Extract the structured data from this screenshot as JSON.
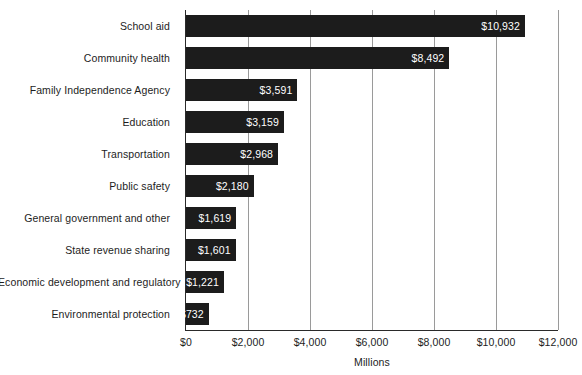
{
  "chart_data": {
    "type": "bar",
    "orientation": "horizontal",
    "title": "",
    "xlabel": "Millions",
    "ylabel": "",
    "xlim": [
      0,
      12000
    ],
    "xticks": [
      0,
      2000,
      4000,
      6000,
      8000,
      10000,
      12000
    ],
    "xtick_labels": [
      "$0",
      "$2,000",
      "$4,000",
      "$6,000",
      "$8,000",
      "$10,000",
      "$12,000"
    ],
    "grid": true,
    "legend": false,
    "bar_color": "#1c1c1c",
    "value_label_color": "#ffffff",
    "gridline_color": "#9a9a9a",
    "axis_color": "#2a2a2a",
    "categories": [
      "School aid",
      "Community health",
      "Family Independence Agency",
      "Education",
      "Transportation",
      "Public safety",
      "General government and other",
      "State revenue sharing",
      "Economic development and regulatory",
      "Environmental protection"
    ],
    "values": [
      10932,
      8492,
      3591,
      3159,
      2968,
      2180,
      1619,
      1601,
      1221,
      732
    ],
    "value_labels": [
      "$10,932",
      "$8,492",
      "$3,591",
      "$3,159",
      "$2,968",
      "$2,180",
      "$1,619",
      "$1,601",
      "$1,221",
      "$732"
    ]
  }
}
